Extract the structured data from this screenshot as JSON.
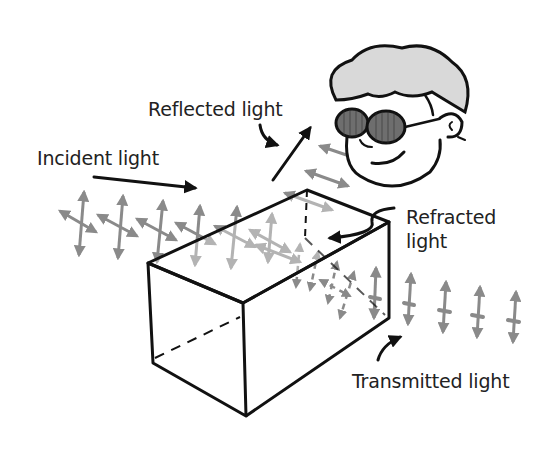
{
  "diagram": {
    "type": "illustration",
    "labels": {
      "incident": "Incident light",
      "reflected": "Reflected light",
      "refracted_line1": "Refracted",
      "refracted_line2": "light",
      "transmitted": "Transmitted light"
    },
    "elements": [
      {
        "id": "incident-beam",
        "desc": "grey double-headed arrows crossing (unpolarized light) traveling toward block"
      },
      {
        "id": "reflected-beam",
        "desc": "grey horizontal double-headed arrows (horizontally polarized) heading toward viewer"
      },
      {
        "id": "transparent-block",
        "desc": "rectangular glass block drawn in perspective with dashed hidden edges"
      },
      {
        "id": "transmitted-beam",
        "desc": "grey vertical double-headed arrows exiting the block"
      },
      {
        "id": "viewer",
        "desc": "cartoon face with curly grey hair and dark polarizing sunglasses"
      }
    ],
    "colors": {
      "ink": "#111111",
      "light_arrows": "#8a8a8a",
      "hair": "#d9d9d9",
      "lenses": "#6e6e6e"
    }
  }
}
